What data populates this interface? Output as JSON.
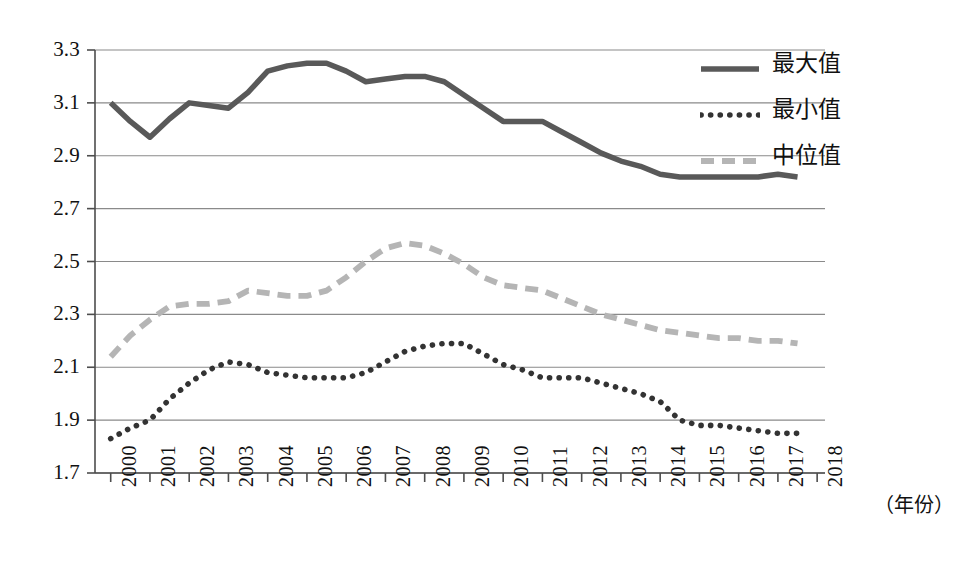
{
  "chart_data": {
    "type": "line",
    "title": "",
    "subtitle": "",
    "xlabel": "（年份）",
    "ylabel": "",
    "xlim": [
      1999.6,
      2018.2
    ],
    "ylim": [
      1.7,
      3.3
    ],
    "y_ticks": [
      "3.3",
      "3.1",
      "2.9",
      "2.7",
      "2.5",
      "2.3",
      "2.1",
      "1.9",
      "1.7"
    ],
    "y_tick_values": [
      3.3,
      3.1,
      2.9,
      2.7,
      2.5,
      2.3,
      2.1,
      1.9,
      1.7
    ],
    "x_ticks": [
      "2000",
      "2001",
      "2002",
      "2003",
      "2004",
      "2005",
      "2006",
      "2007",
      "2008",
      "2009",
      "2010",
      "2011",
      "2012",
      "2013",
      "2014",
      "2015",
      "2016",
      "2017",
      "2018"
    ],
    "x_tick_values": [
      2000,
      2001,
      2002,
      2003,
      2004,
      2005,
      2006,
      2007,
      2008,
      2009,
      2010,
      2011,
      2012,
      2013,
      2014,
      2015,
      2016,
      2017,
      2018
    ],
    "grid": "horizontal",
    "legend_position": "top-right",
    "legend": [
      "最大值",
      "最小值",
      "中位值"
    ],
    "series": [
      {
        "name": "最大值",
        "style": "solid",
        "color": "#595959",
        "x": [
          2000.0,
          2000.5,
          2001.0,
          2001.5,
          2002.0,
          2002.5,
          2003.0,
          2003.5,
          2004.0,
          2004.5,
          2005.0,
          2005.5,
          2006.0,
          2006.5,
          2007.0,
          2007.5,
          2008.0,
          2008.5,
          2009.0,
          2009.5,
          2010.0,
          2010.5,
          2011.0,
          2011.5,
          2012.0,
          2012.5,
          2013.0,
          2013.5,
          2014.0,
          2014.5,
          2015.0,
          2015.5,
          2016.0,
          2016.5,
          2017.0,
          2017.5
        ],
        "values": [
          3.1,
          3.03,
          2.97,
          3.04,
          3.1,
          3.09,
          3.08,
          3.14,
          3.22,
          3.24,
          3.25,
          3.25,
          3.22,
          3.18,
          3.19,
          3.2,
          3.2,
          3.18,
          3.13,
          3.08,
          3.03,
          3.03,
          3.03,
          2.99,
          2.95,
          2.91,
          2.88,
          2.86,
          2.83,
          2.82,
          2.82,
          2.82,
          2.82,
          2.82,
          2.83,
          2.82
        ]
      },
      {
        "name": "最小值",
        "style": "dotted",
        "color": "#333333",
        "x": [
          2000.0,
          2000.5,
          2001.0,
          2001.5,
          2002.0,
          2002.5,
          2003.0,
          2003.5,
          2004.0,
          2004.5,
          2005.0,
          2005.5,
          2006.0,
          2006.5,
          2007.0,
          2007.5,
          2008.0,
          2008.5,
          2009.0,
          2009.5,
          2010.0,
          2010.5,
          2011.0,
          2011.5,
          2012.0,
          2012.5,
          2013.0,
          2013.5,
          2014.0,
          2014.5,
          2015.0,
          2015.5,
          2016.0,
          2016.5,
          2017.0,
          2017.5
        ],
        "values": [
          1.83,
          1.87,
          1.9,
          1.98,
          2.04,
          2.09,
          2.12,
          2.11,
          2.08,
          2.07,
          2.06,
          2.06,
          2.06,
          2.08,
          2.12,
          2.16,
          2.18,
          2.19,
          2.19,
          2.15,
          2.11,
          2.09,
          2.06,
          2.06,
          2.06,
          2.04,
          2.02,
          2.0,
          1.97,
          1.9,
          1.88,
          1.88,
          1.87,
          1.86,
          1.85,
          1.85
        ]
      },
      {
        "name": "中位值",
        "style": "dashed",
        "color": "#b5b5b5",
        "x": [
          2000.0,
          2000.5,
          2001.0,
          2001.5,
          2002.0,
          2002.5,
          2003.0,
          2003.5,
          2004.0,
          2004.5,
          2005.0,
          2005.5,
          2006.0,
          2006.5,
          2007.0,
          2007.5,
          2008.0,
          2008.5,
          2009.0,
          2009.5,
          2010.0,
          2010.5,
          2011.0,
          2011.5,
          2012.0,
          2012.5,
          2013.0,
          2013.5,
          2014.0,
          2014.5,
          2015.0,
          2015.5,
          2016.0,
          2016.5,
          2017.0,
          2017.5
        ],
        "values": [
          2.14,
          2.22,
          2.28,
          2.33,
          2.34,
          2.34,
          2.35,
          2.39,
          2.38,
          2.37,
          2.37,
          2.39,
          2.44,
          2.5,
          2.55,
          2.57,
          2.56,
          2.53,
          2.49,
          2.44,
          2.41,
          2.4,
          2.39,
          2.36,
          2.33,
          2.3,
          2.28,
          2.26,
          2.24,
          2.23,
          2.22,
          2.21,
          2.21,
          2.2,
          2.2,
          2.19
        ]
      }
    ]
  },
  "axis": {
    "x_unit_caption": "（年份）"
  },
  "legend": {
    "items": [
      {
        "label": "最大值",
        "style": "solid",
        "color": "#595959",
        "icon": "solid-line-swatch"
      },
      {
        "label": "最小值",
        "style": "dotted",
        "color": "#333333",
        "icon": "dotted-line-swatch"
      },
      {
        "label": "中位值",
        "style": "dashed",
        "color": "#b5b5b5",
        "icon": "dashed-line-swatch"
      }
    ]
  },
  "colors": {
    "max_series": "#595959",
    "min_series": "#333333",
    "median_series": "#b5b5b5",
    "grid": "#8a8a8a",
    "axis": "#4d4d4d",
    "background": "#ffffff"
  }
}
